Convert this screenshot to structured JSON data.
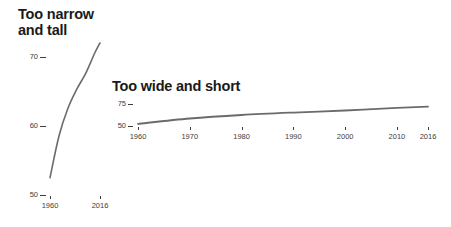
{
  "chart_data": [
    {
      "type": "line",
      "title": "Too narrow\nand tall",
      "xlabel": "",
      "ylabel": "",
      "x": [
        1960,
        1970,
        1980,
        1990,
        2000,
        2010,
        2016
      ],
      "values": [
        52.5,
        58.5,
        62.5,
        65.3,
        67.6,
        70.5,
        72.0
      ],
      "series": [
        {
          "name": "series-1",
          "values": [
            52.5,
            58.5,
            62.5,
            65.3,
            67.6,
            70.5,
            72.0
          ]
        }
      ],
      "y_ticks": [
        "50",
        "60",
        "70"
      ],
      "y_tick_values": [
        50,
        60,
        70
      ],
      "x_ticks": [
        "1960",
        "2016"
      ],
      "x_tick_values": [
        1960,
        2016
      ],
      "ylim": [
        50,
        73
      ],
      "xlim": [
        1960,
        2016
      ],
      "grid": false,
      "legend": false,
      "line_color": "#6b6b6b"
    },
    {
      "type": "line",
      "title": "Too wide and short",
      "xlabel": "",
      "ylabel": "",
      "x": [
        1960,
        1970,
        1980,
        1990,
        2000,
        2010,
        2016
      ],
      "values": [
        52.5,
        58.5,
        62.5,
        65.3,
        67.6,
        70.5,
        72.0
      ],
      "series": [
        {
          "name": "series-1",
          "values": [
            52.5,
            58.5,
            62.5,
            65.3,
            67.6,
            70.5,
            72.0
          ]
        }
      ],
      "y_ticks": [
        "75",
        "50"
      ],
      "y_tick_values": [
        75,
        50
      ],
      "x_ticks": [
        "1960",
        "1970",
        "1980",
        "1990",
        "2000",
        "2010",
        "2016"
      ],
      "x_tick_values": [
        1960,
        1970,
        1980,
        1990,
        2000,
        2010,
        2016
      ],
      "ylim": [
        50,
        75
      ],
      "xlim": [
        1960,
        2016
      ],
      "grid": false,
      "legend": false,
      "line_color": "#6b6b6b"
    }
  ],
  "charts": {
    "narrow": {
      "title": "Too narrow\nand tall",
      "y_ticks": [
        "70",
        "60",
        "50"
      ],
      "x_ticks": [
        "1960",
        "2016"
      ]
    },
    "wide": {
      "title": "Too wide and short",
      "y_ticks": [
        "75",
        "50"
      ],
      "x_ticks": [
        "1960",
        "1970",
        "1980",
        "1990",
        "2000",
        "2010",
        "2016"
      ]
    }
  },
  "colors": {
    "line": "#6b6b6b",
    "title": "#1a1a1a",
    "tick": "#3d3d3d",
    "background": "#ffffff"
  }
}
